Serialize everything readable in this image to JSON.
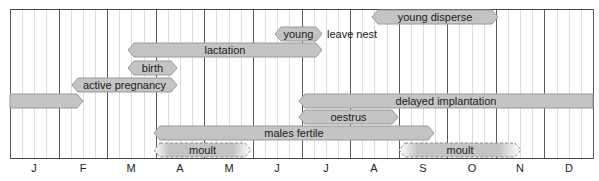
{
  "diagram": {
    "type": "annual-timeline",
    "months": [
      "J",
      "F",
      "M",
      "A",
      "M",
      "J",
      "J",
      "A",
      "S",
      "O",
      "N",
      "D"
    ],
    "colors": {
      "bar_fill": "#c4c4c4",
      "bar_stroke": "#9a9a9a",
      "major_gridline": "#5a5a5a",
      "minor_gridline": "#dcdcdc",
      "moult_dash": "#8a8a8a"
    },
    "bars": [
      {
        "id": "young-disperse",
        "label": "young disperse",
        "x1": 372,
        "x2": 498,
        "y": 10,
        "left_arrow": true,
        "right_arrow": true,
        "style": "solid"
      },
      {
        "id": "young",
        "label": "young",
        "x1": 275,
        "x2": 322,
        "y": 27,
        "left_arrow": true,
        "right_arrow": true,
        "style": "solid"
      },
      {
        "id": "lactation",
        "label": "lactation",
        "x1": 128,
        "x2": 322,
        "y": 43,
        "left_arrow": true,
        "right_arrow": true,
        "style": "solid"
      },
      {
        "id": "birth",
        "label": "birth",
        "x1": 128,
        "x2": 177,
        "y": 61,
        "left_arrow": true,
        "right_arrow": true,
        "style": "solid"
      },
      {
        "id": "active-pregnancy",
        "label": "active pregnancy",
        "x1": 72,
        "x2": 177,
        "y": 78,
        "left_arrow": true,
        "right_arrow": true,
        "style": "solid"
      },
      {
        "id": "delayed-implantation-early",
        "label": "",
        "x1": 10,
        "x2": 83,
        "y": 94,
        "left_arrow": false,
        "right_arrow": true,
        "style": "solid"
      },
      {
        "id": "delayed-implantation",
        "label": "delayed implantation",
        "x1": 299,
        "x2": 593,
        "y": 94,
        "left_arrow": true,
        "right_arrow": false,
        "style": "solid"
      },
      {
        "id": "oestrus",
        "label": "oestrus",
        "x1": 299,
        "x2": 398,
        "y": 110,
        "left_arrow": true,
        "right_arrow": true,
        "style": "solid"
      },
      {
        "id": "males-fertile",
        "label": "males fertile",
        "x1": 154,
        "x2": 434,
        "y": 126,
        "left_arrow": true,
        "right_arrow": true,
        "style": "solid"
      },
      {
        "id": "moult-spring",
        "label": "moult",
        "x1": 154,
        "x2": 251,
        "y": 143,
        "left_arrow": true,
        "right_arrow": true,
        "style": "dashed-gradient"
      },
      {
        "id": "moult-autumn",
        "label": "moult",
        "x1": 399,
        "x2": 521,
        "y": 143,
        "left_arrow": true,
        "right_arrow": true,
        "style": "dashed-gradient"
      }
    ],
    "annotations": [
      {
        "id": "leave-nest",
        "text": "leave nest",
        "x": 327,
        "y": 27
      }
    ]
  }
}
